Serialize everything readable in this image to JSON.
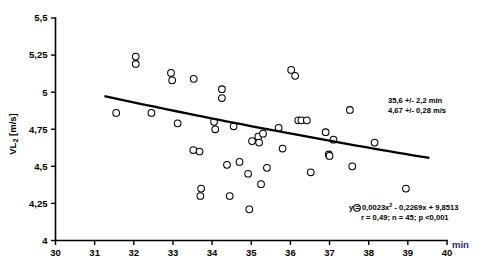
{
  "chart_data": {
    "type": "scatter",
    "title": "",
    "xlabel": "min",
    "ylabel": "VL2 [m/s]",
    "ylabel_main": "VL",
    "ylabel_sub": "2",
    "ylabel_unit": " [m/s]",
    "xlim": [
      30,
      40
    ],
    "ylim": [
      4,
      5.5
    ],
    "xticks": [
      30,
      31,
      32,
      33,
      34,
      35,
      36,
      37,
      38,
      39,
      40
    ],
    "xtick_labels": [
      "30",
      "31",
      "32",
      "33",
      "34",
      "35",
      "36",
      "37",
      "38",
      "39",
      "40"
    ],
    "yticks": [
      4,
      4.25,
      4.5,
      4.75,
      5,
      5.25,
      5.5
    ],
    "ytick_labels": [
      "4",
      "4,25",
      "4,5",
      "4,75",
      "5",
      "5,25",
      "5,5"
    ],
    "grid": false,
    "legend": "none",
    "marker_style": "open-circle-3d",
    "points": [
      {
        "x": 31.55,
        "y": 4.86
      },
      {
        "x": 32.05,
        "y": 5.24
      },
      {
        "x": 32.05,
        "y": 5.19
      },
      {
        "x": 32.45,
        "y": 4.86
      },
      {
        "x": 32.95,
        "y": 5.13
      },
      {
        "x": 32.98,
        "y": 5.08
      },
      {
        "x": 33.12,
        "y": 4.79
      },
      {
        "x": 33.53,
        "y": 5.09
      },
      {
        "x": 33.52,
        "y": 4.61
      },
      {
        "x": 33.68,
        "y": 4.6
      },
      {
        "x": 33.72,
        "y": 4.35
      },
      {
        "x": 33.7,
        "y": 4.3
      },
      {
        "x": 34.05,
        "y": 4.8
      },
      {
        "x": 34.08,
        "y": 4.75
      },
      {
        "x": 34.25,
        "y": 5.02
      },
      {
        "x": 34.25,
        "y": 4.96
      },
      {
        "x": 34.38,
        "y": 4.51
      },
      {
        "x": 34.45,
        "y": 4.3
      },
      {
        "x": 34.55,
        "y": 4.77
      },
      {
        "x": 34.7,
        "y": 4.53
      },
      {
        "x": 34.92,
        "y": 4.45
      },
      {
        "x": 34.95,
        "y": 4.21
      },
      {
        "x": 35.02,
        "y": 4.67
      },
      {
        "x": 35.18,
        "y": 4.7
      },
      {
        "x": 35.2,
        "y": 4.66
      },
      {
        "x": 35.25,
        "y": 4.38
      },
      {
        "x": 35.3,
        "y": 4.72
      },
      {
        "x": 35.4,
        "y": 4.49
      },
      {
        "x": 35.7,
        "y": 4.76
      },
      {
        "x": 35.8,
        "y": 4.62
      },
      {
        "x": 36.02,
        "y": 5.15
      },
      {
        "x": 36.12,
        "y": 5.11
      },
      {
        "x": 36.2,
        "y": 4.81
      },
      {
        "x": 36.28,
        "y": 4.81
      },
      {
        "x": 36.42,
        "y": 4.81
      },
      {
        "x": 36.52,
        "y": 4.46
      },
      {
        "x": 36.9,
        "y": 4.73
      },
      {
        "x": 36.98,
        "y": 4.58
      },
      {
        "x": 37.0,
        "y": 4.57
      },
      {
        "x": 37.1,
        "y": 4.68
      },
      {
        "x": 37.52,
        "y": 4.88
      },
      {
        "x": 37.58,
        "y": 4.5
      },
      {
        "x": 37.7,
        "y": 4.22
      },
      {
        "x": 38.15,
        "y": 4.66
      },
      {
        "x": 38.95,
        "y": 4.35
      }
    ],
    "trend_line": {
      "equation": "y = 0,0023x² - 0,2269x + 9,8513",
      "a": 0.0023,
      "b": -0.2269,
      "c": 9.8513,
      "x_start": 31.25,
      "x_end": 39.55,
      "y_start": 4.955,
      "y_end": 4.6
    },
    "annotations": {
      "stats_line1": "35,6 +/- 2,2 min",
      "stats_line2": "4,67 +/- 0,28 m/s",
      "equation_line": "y = 0,0023x",
      "equation_exponent": "2",
      "equation_rest": " - 0,2269x + 9,8513",
      "fit_stats": "r = 0,49; n = 45; p  <0,001"
    }
  },
  "colors": {
    "axis": "#000000",
    "marker_fill": "#ffffff",
    "marker_stroke": "#000000",
    "trend": "#000000",
    "xlabel_color": "#1b2a86",
    "background": "#ffffff"
  }
}
